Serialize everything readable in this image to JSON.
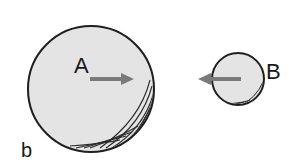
{
  "figure": {
    "panel_label": "b",
    "bodies": [
      {
        "label": "A",
        "size": "large",
        "arrow_direction": "right"
      },
      {
        "label": "B",
        "size": "small",
        "arrow_direction": "left"
      }
    ],
    "colors": {
      "fill": "#e4e4e4",
      "outline": "#1f1f1f",
      "arrow": "#7a7a7a",
      "shading": "#2a2a2a"
    }
  }
}
